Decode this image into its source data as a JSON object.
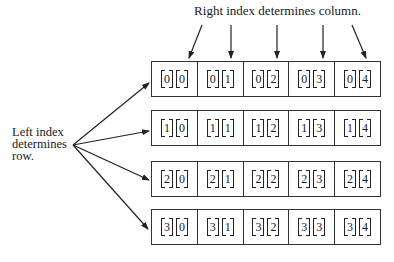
{
  "diagram": {
    "top_label": "Right index determines column.",
    "left_label_lines": [
      "Left index",
      "determines",
      "row."
    ],
    "rows": [
      {
        "cells": [
          [
            "0",
            "0"
          ],
          [
            "0",
            "1"
          ],
          [
            "0",
            "2"
          ],
          [
            "0",
            "3"
          ],
          [
            "0",
            "4"
          ]
        ]
      },
      {
        "cells": [
          [
            "1",
            "0"
          ],
          [
            "1",
            "1"
          ],
          [
            "1",
            "2"
          ],
          [
            "1",
            "3"
          ],
          [
            "1",
            "4"
          ]
        ]
      },
      {
        "cells": [
          [
            "2",
            "0"
          ],
          [
            "2",
            "1"
          ],
          [
            "2",
            "2"
          ],
          [
            "2",
            "3"
          ],
          [
            "2",
            "4"
          ]
        ]
      },
      {
        "cells": [
          [
            "3",
            "0"
          ],
          [
            "3",
            "1"
          ],
          [
            "3",
            "2"
          ],
          [
            "3",
            "3"
          ],
          [
            "3",
            "4"
          ]
        ]
      }
    ],
    "colors": {
      "line": "#222222",
      "background": "#ffffff"
    }
  }
}
